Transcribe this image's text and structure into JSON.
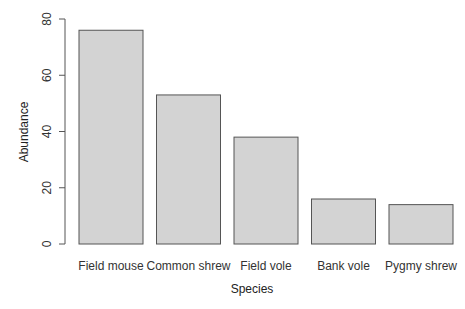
{
  "chart_data": {
    "type": "bar",
    "title": "",
    "xlabel": "Species",
    "ylabel": "Abundance",
    "categories": [
      "Field mouse",
      "Common shrew",
      "Field vole",
      "Bank vole",
      "Pygmy shrew"
    ],
    "values": [
      76,
      53,
      38,
      16,
      14
    ],
    "ylim": [
      0,
      80
    ],
    "yticks": [
      "0",
      "20",
      "40",
      "60",
      "80"
    ],
    "grid": false,
    "legend": null,
    "bar_color": "#d3d3d3",
    "bar_border": "#555555"
  }
}
